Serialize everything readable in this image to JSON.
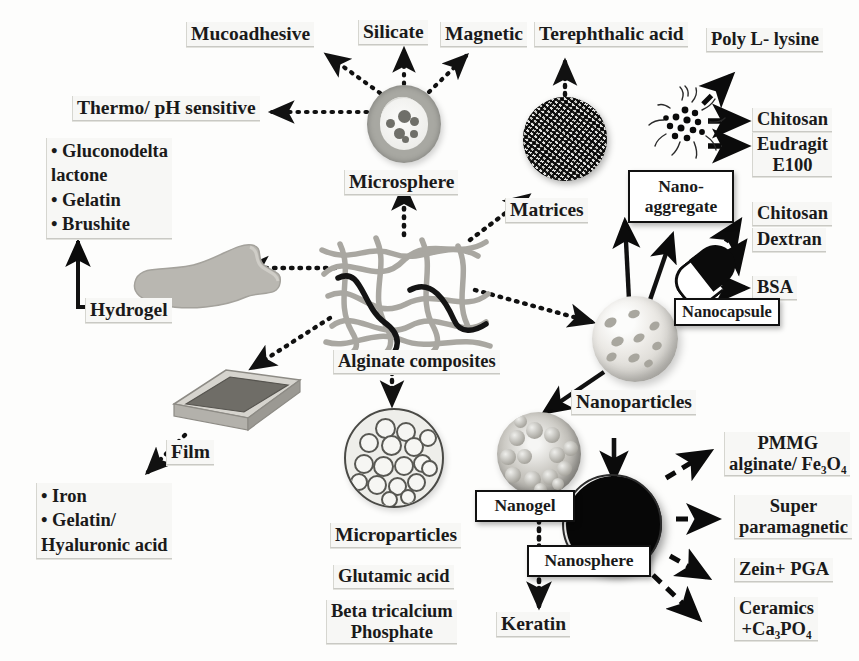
{
  "figure": {
    "hub_label": "polymer fiber network"
  },
  "nodes": {
    "microsphere": "Microsphere",
    "matrices": "Matrices",
    "nano_aggregate": "Nano-\naggregate",
    "nanocapsule": "Nanocapsule",
    "nanoparticles": "Nanoparticles",
    "nanosphere": "Nanosphere",
    "nanogel": "Nanogel",
    "microparticles": "Microparticles",
    "film": "Film",
    "hydrogel": "Hydrogel",
    "alginate_composites": "Alginate composites"
  },
  "labels": {
    "mucoadhesive": "Mucoadhesive",
    "silicate": "Silicate",
    "magnetic": "Magnetic",
    "thermo_ph": "Thermo/ pH sensitive",
    "terephthalic_acid": "Terephthalic acid",
    "poly_l_lysine": "Poly L- lysine",
    "chitosan_top": "Chitosan",
    "eudragit": "Eudragit\nE100",
    "chitosan_mid": "Chitosan",
    "dextran": "Dextran",
    "bsa": "BSA",
    "hydrogel_materials": "• Gluconodelta\n   lactone\n• Gelatin\n• Brushite",
    "film_materials": "• Iron\n• Gelatin/\n   Hyaluronic acid",
    "glutamic_acid": "Glutamic acid",
    "beta_tricalcium": "Beta tricalcium\nPhosphate",
    "keratin": "Keratin",
    "pmmg": "PMMG\nalginate/ Fe₃O₄",
    "superparamagnetic": "Super\nparamagnetic",
    "zein_pga": "Zein+ PGA",
    "ceramics": "Ceramics\n+Ca₃PO₄"
  },
  "colors": {
    "ink": "#1a1a1a",
    "chip_bg": "#f7f7f5",
    "fiber_light": "#a9a7a1",
    "fiber_dark": "#141414",
    "nanosphere": "#070707"
  }
}
